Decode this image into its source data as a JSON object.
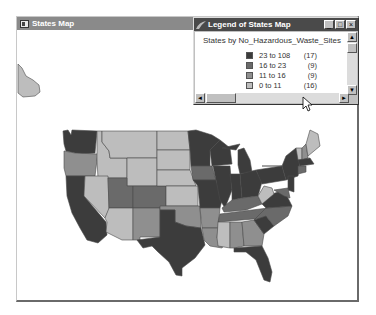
{
  "main_window": {
    "title": "States Map",
    "icon": "map-window-icon"
  },
  "legend_window": {
    "title": "Legend of States Map",
    "icon": "legend-window-icon",
    "controls": {
      "minimize": "_",
      "maximize": "□",
      "close": "×"
    },
    "heading": "States by No_Hazardous_Waste_Sites",
    "classes": [
      {
        "range": "23 to 108",
        "count": "(17)",
        "color": "#3c3c3c"
      },
      {
        "range": "16 to  23",
        "count": "(9)",
        "color": "#6a6a6a"
      },
      {
        "range": "11 to  16",
        "count": "(9)",
        "color": "#8f8f8f"
      },
      {
        "range": " 0 to  11",
        "count": "(16)",
        "color": "#bdbdbd"
      }
    ],
    "scroll": {
      "up": "▲",
      "down": "▼",
      "left": "◄",
      "right": "►"
    }
  },
  "map": {
    "colors": {
      "c1": "#3c3c3c",
      "c2": "#6a6a6a",
      "c3": "#8f8f8f",
      "c4": "#bdbdbd",
      "border": "#4a4a4a"
    }
  }
}
